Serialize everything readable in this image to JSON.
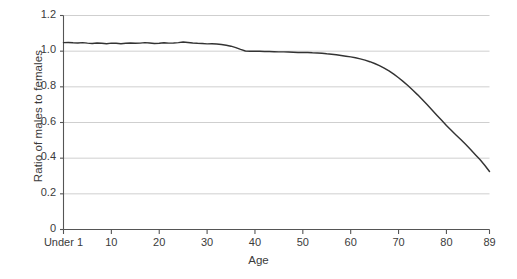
{
  "chart_data": {
    "type": "line",
    "title": "",
    "xlabel": "Age",
    "ylabel": "Ratio of males to females",
    "xlim": [
      0,
      89
    ],
    "ylim": [
      0,
      1.2
    ],
    "grid": true,
    "legend": null,
    "series_name": "Ratio of males to females",
    "line_color": "#333333",
    "grid_color": "#c9c9c9",
    "axis_color": "#555555",
    "background": "#ffffff",
    "ytick_labels": [
      "1.2",
      "1.0",
      "0.8",
      "0.6",
      "0.4",
      "0.2",
      "0"
    ],
    "ytick_values": [
      1.2,
      1.0,
      0.8,
      0.6,
      0.4,
      0.2,
      0
    ],
    "xtick_labels": [
      "Under 1",
      "10",
      "20",
      "30",
      "40",
      "50",
      "60",
      "70",
      "80",
      "89"
    ],
    "xtick_values": [
      0,
      10,
      20,
      30,
      40,
      50,
      60,
      70,
      80,
      89
    ],
    "x": [
      0,
      1,
      2,
      3,
      4,
      5,
      6,
      7,
      8,
      9,
      10,
      11,
      12,
      13,
      14,
      15,
      16,
      17,
      18,
      19,
      20,
      21,
      22,
      23,
      24,
      25,
      26,
      27,
      28,
      29,
      30,
      31,
      32,
      33,
      34,
      35,
      36,
      37,
      38,
      39,
      40,
      41,
      42,
      43,
      44,
      45,
      46,
      47,
      48,
      49,
      50,
      51,
      52,
      53,
      54,
      55,
      56,
      57,
      58,
      59,
      60,
      61,
      62,
      63,
      64,
      65,
      66,
      67,
      68,
      69,
      70,
      71,
      72,
      73,
      74,
      75,
      76,
      77,
      78,
      79,
      80,
      81,
      82,
      83,
      84,
      85,
      86,
      87,
      88,
      89
    ],
    "values": [
      1.048,
      1.049,
      1.047,
      1.046,
      1.048,
      1.045,
      1.043,
      1.046,
      1.044,
      1.042,
      1.045,
      1.044,
      1.042,
      1.044,
      1.046,
      1.044,
      1.045,
      1.048,
      1.046,
      1.043,
      1.044,
      1.047,
      1.045,
      1.046,
      1.048,
      1.051,
      1.049,
      1.046,
      1.044,
      1.043,
      1.041,
      1.042,
      1.04,
      1.037,
      1.033,
      1.028,
      1.02,
      1.01,
      1.001,
      1.0,
      1.0,
      0.999,
      0.998,
      0.998,
      0.997,
      0.996,
      0.996,
      0.995,
      0.994,
      0.993,
      0.992,
      0.993,
      0.991,
      0.99,
      0.988,
      0.985,
      0.983,
      0.98,
      0.976,
      0.972,
      0.968,
      0.963,
      0.957,
      0.95,
      0.941,
      0.931,
      0.919,
      0.905,
      0.889,
      0.871,
      0.851,
      0.829,
      0.806,
      0.781,
      0.755,
      0.727,
      0.699,
      0.67,
      0.641,
      0.612,
      0.583,
      0.556,
      0.53,
      0.505,
      0.478,
      0.45,
      0.421,
      0.392,
      0.36,
      0.325
    ]
  }
}
